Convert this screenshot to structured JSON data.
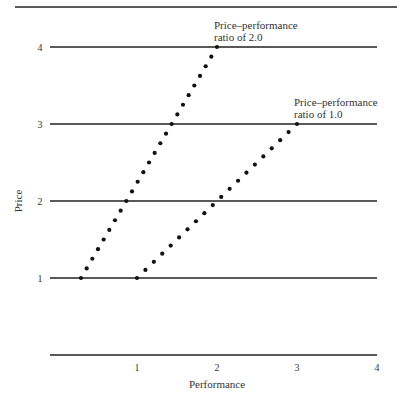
{
  "chart_data": {
    "type": "scatter",
    "title": "",
    "xlabel": "Performance",
    "ylabel": "Price",
    "xlim": [
      0,
      4
    ],
    "ylim": [
      0,
      4
    ],
    "x_ticks": [
      "1",
      "2",
      "3",
      "4"
    ],
    "y_ticks": [
      "1",
      "2",
      "3",
      "4"
    ],
    "grid": "horizontal",
    "series": [
      {
        "name": "Price–performance ratio of 2.0",
        "style": "dotted line",
        "start": [
          0.3,
          1
        ],
        "end": [
          2,
          4
        ],
        "points": 24
      },
      {
        "name": "Price–performance ratio of 1.0",
        "style": "dotted line",
        "start": [
          1,
          1
        ],
        "end": [
          3,
          3
        ],
        "points": 19
      }
    ],
    "annotations": [
      {
        "lines": [
          "Price–performance",
          "ratio of 2.0"
        ],
        "at": [
          2,
          4
        ]
      },
      {
        "lines": [
          "Price–performance",
          "ratio of 1.0"
        ],
        "at": [
          3,
          3
        ]
      }
    ]
  }
}
